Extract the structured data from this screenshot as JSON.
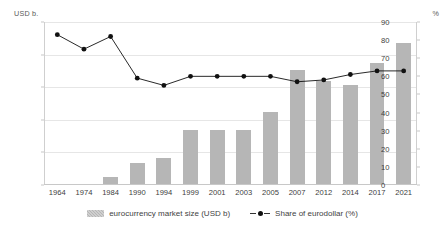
{
  "chart_data": {
    "type": "bar",
    "title": "",
    "xlabel": "",
    "ylabel": "USD b.",
    "y2label": "%",
    "grid": true,
    "legend_position": "bottom",
    "categories": [
      "1964",
      "1974",
      "1984",
      "1990",
      "1994",
      "1999",
      "2001",
      "2003",
      "2005",
      "2007",
      "2012",
      "2014",
      "2017",
      "2021"
    ],
    "ylim": [
      0,
      25000
    ],
    "yticks": [
      "0",
      "5,000",
      "10,000",
      "15,000",
      "20,000",
      "25,000"
    ],
    "ytick_values": [
      0,
      5000,
      10000,
      15000,
      20000,
      25000
    ],
    "y2lim": [
      0,
      90
    ],
    "y2ticks": [
      "0",
      "10",
      "20",
      "30",
      "40",
      "50",
      "60",
      "70",
      "80",
      "90"
    ],
    "y2tick_values": [
      0,
      10,
      20,
      30,
      40,
      50,
      60,
      70,
      80,
      90
    ],
    "series": [
      {
        "name": "eurocurrency market size (USD b)",
        "type": "bar",
        "axis": "left",
        "color": "#b6b6b6",
        "values": [
          50,
          200,
          1300,
          3400,
          4200,
          8500,
          8500,
          8400,
          11200,
          17700,
          16000,
          15300,
          18700,
          21800
        ]
      },
      {
        "name": "Share of eurodollar (%)",
        "type": "line",
        "axis": "right",
        "color": "#111111",
        "values": [
          83,
          75,
          82,
          59,
          55,
          60,
          60,
          60,
          60,
          57,
          58,
          61,
          63,
          63
        ]
      }
    ]
  },
  "axes": {
    "left_unit": "USD b.",
    "right_unit": "%"
  },
  "legend": {
    "bar_label": "eurocurrency market size (USD b)",
    "line_label": "Share of eurodollar (%)"
  }
}
